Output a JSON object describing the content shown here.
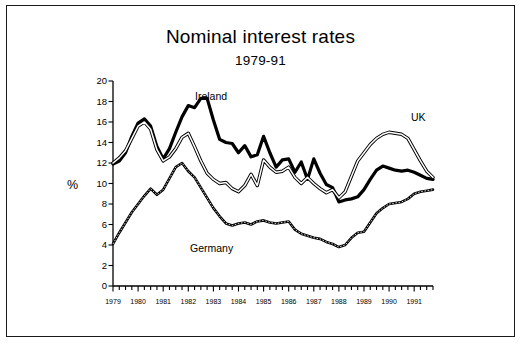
{
  "figure": {
    "title": "Nominal interest rates",
    "subtitle": "1979-91",
    "axis_unit": "%"
  },
  "labels": {
    "ireland": "Ireland",
    "uk": "UK",
    "germany": "Germany"
  },
  "colors": {
    "ink": "#000000",
    "background": "#ffffff",
    "border": "#1a1a1a"
  },
  "chart_data": {
    "type": "line",
    "title": "Nominal interest rates",
    "subtitle": "1979-91",
    "xlabel": "",
    "ylabel": "%",
    "ylim": [
      0,
      20
    ],
    "ytick_step": 2,
    "yticks": [
      0,
      2,
      4,
      6,
      8,
      10,
      12,
      14,
      16,
      18,
      20
    ],
    "xlim": [
      1979.0,
      1991.75
    ],
    "xticks": [
      1979,
      1980,
      1981,
      1982,
      1983,
      1984,
      1985,
      1986,
      1987,
      1988,
      1989,
      1990,
      1991
    ],
    "xtick_labels": [
      "1979",
      "1980",
      "1981",
      "1982",
      "1983",
      "1984",
      "1985",
      "1986",
      "1987",
      "1988",
      "1989",
      "1990",
      "1991"
    ],
    "minor_ticks_per_year": 4,
    "grid": false,
    "legend": "inline-annotations",
    "x": [
      1979.0,
      1979.25,
      1979.5,
      1979.75,
      1980.0,
      1980.25,
      1980.5,
      1980.75,
      1981.0,
      1981.25,
      1981.5,
      1981.75,
      1982.0,
      1982.25,
      1982.5,
      1982.75,
      1983.0,
      1983.25,
      1983.5,
      1983.75,
      1984.0,
      1984.25,
      1984.5,
      1984.75,
      1985.0,
      1985.25,
      1985.5,
      1985.75,
      1986.0,
      1986.25,
      1986.5,
      1986.75,
      1987.0,
      1987.25,
      1987.5,
      1987.75,
      1988.0,
      1988.25,
      1988.5,
      1988.75,
      1989.0,
      1989.25,
      1989.5,
      1989.75,
      1990.0,
      1990.25,
      1990.5,
      1990.75,
      1991.0,
      1991.25,
      1991.5,
      1991.75
    ],
    "series": [
      {
        "name": "Ireland",
        "style": "thick-solid-black",
        "values": [
          11.9,
          12.2,
          13.0,
          14.6,
          15.9,
          16.3,
          15.6,
          13.6,
          12.4,
          13.4,
          15.0,
          16.5,
          17.6,
          17.4,
          18.3,
          18.3,
          16.2,
          14.3,
          14.0,
          13.9,
          13.0,
          13.7,
          12.6,
          12.8,
          14.6,
          13.0,
          11.6,
          12.3,
          12.4,
          11.1,
          12.1,
          10.4,
          12.4,
          11.0,
          9.9,
          9.6,
          8.2,
          8.4,
          8.5,
          8.7,
          9.4,
          10.4,
          11.3,
          11.7,
          11.5,
          11.3,
          11.2,
          11.3,
          11.1,
          10.8,
          10.5,
          10.4
        ]
      },
      {
        "name": "UK",
        "style": "outlined-white",
        "values": [
          12.0,
          12.5,
          13.2,
          14.4,
          15.6,
          16.0,
          15.3,
          13.3,
          12.2,
          12.6,
          13.4,
          14.5,
          14.9,
          13.6,
          12.2,
          11.0,
          10.4,
          10.0,
          10.1,
          9.5,
          9.2,
          9.8,
          10.9,
          9.8,
          12.3,
          11.6,
          11.1,
          11.2,
          11.6,
          10.6,
          10.0,
          10.6,
          10.0,
          9.5,
          9.1,
          9.4,
          8.6,
          9.2,
          10.7,
          12.2,
          13.0,
          13.8,
          14.4,
          14.8,
          15.0,
          14.9,
          14.8,
          14.4,
          13.3,
          12.2,
          11.2,
          10.6
        ]
      },
      {
        "name": "Germany",
        "style": "thin-double-line",
        "values": [
          4.1,
          5.2,
          6.2,
          7.2,
          8.0,
          8.8,
          9.5,
          8.9,
          9.4,
          10.5,
          11.6,
          12.0,
          11.2,
          10.6,
          9.6,
          8.6,
          7.6,
          6.8,
          6.1,
          5.9,
          6.1,
          6.2,
          6.0,
          6.3,
          6.4,
          6.2,
          6.1,
          6.2,
          6.3,
          5.5,
          5.1,
          4.9,
          4.7,
          4.6,
          4.3,
          4.1,
          3.8,
          4.0,
          4.7,
          5.2,
          5.3,
          6.2,
          7.1,
          7.6,
          8.0,
          8.1,
          8.2,
          8.5,
          9.0,
          9.2,
          9.3,
          9.4
        ]
      }
    ]
  }
}
